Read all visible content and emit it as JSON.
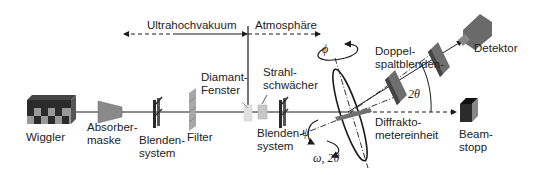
{
  "regions": {
    "vacuum": "Ultrahochvakuum",
    "atmosphere": "Atmosphäre"
  },
  "components": {
    "wiggler": "Wiggler",
    "absorber": [
      "Absorber-",
      "maske"
    ],
    "slit1": [
      "Blenden-",
      "system"
    ],
    "filter": "Filter",
    "window": [
      "Diamant-",
      "Fenster"
    ],
    "attenuator": [
      "Strahl-",
      "schwächer"
    ],
    "slit2": [
      "Blenden-",
      "system"
    ],
    "doubleslit": [
      "Doppel-",
      "spaltblenden-"
    ],
    "detector": "Detektor",
    "diffractometer": [
      "Diffrakto-",
      "metereinheit"
    ],
    "beamstop": [
      "Beam-",
      "stopp"
    ]
  },
  "angles": {
    "phi": "ϕ",
    "psi": "ψ",
    "omega": "ω, 2θ",
    "two_theta": "2θ"
  },
  "colors": {
    "line": "#1a1a1a",
    "dark": "#2b2b2b",
    "mid": "#7a7a7a",
    "light": "#bdbdbd"
  }
}
